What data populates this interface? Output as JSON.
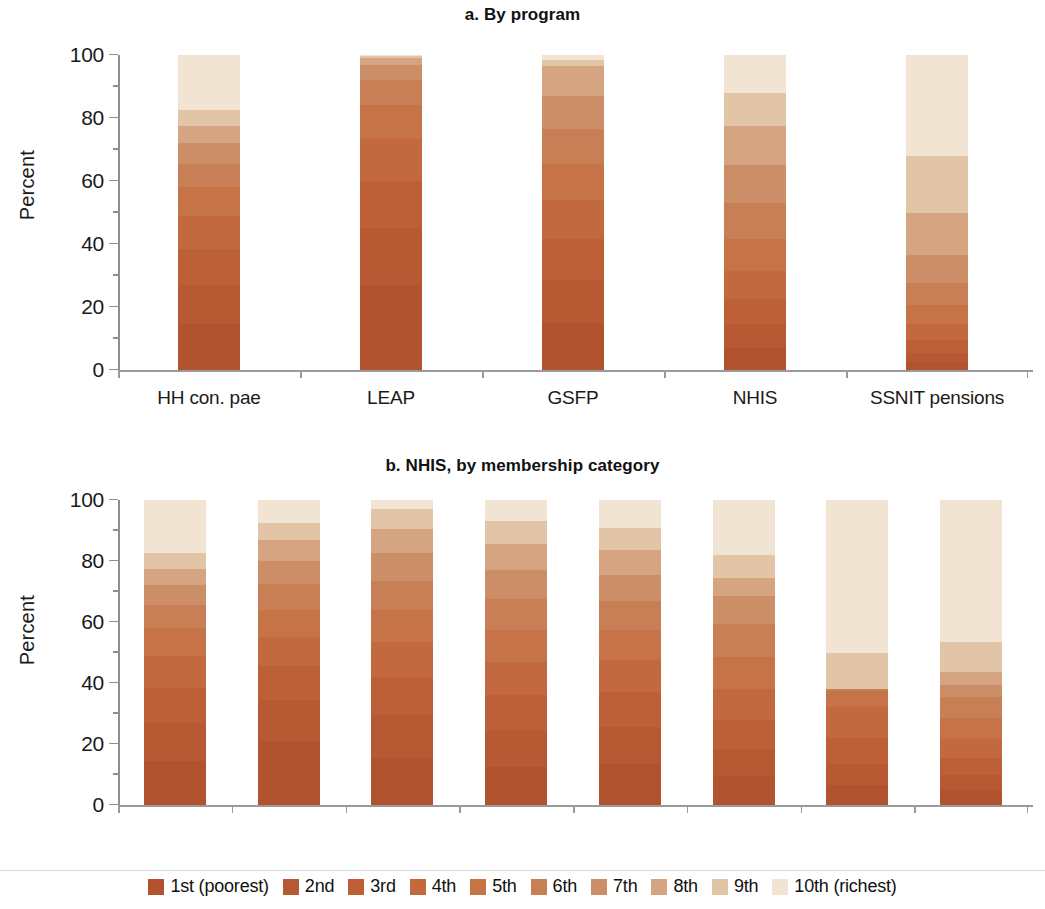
{
  "figure": {
    "y_axis_title": "Percent",
    "y_ticks": [
      "0",
      "20",
      "40",
      "60",
      "80",
      "100"
    ]
  },
  "panel_a": {
    "title": "a. By program",
    "y_axis_title": "Percent",
    "categories": [
      "HH con. pae",
      "LEAP",
      "GSFP",
      "NHIS",
      "SSNIT pensions"
    ]
  },
  "panel_b": {
    "title": "b. NHIS, by membership category",
    "y_axis_title": "Percent",
    "categories": [
      "HH con.\npae",
      "Indigent",
      "Age <18\nyears",
      "FMC",
      "Age ≥70\nyears",
      "Self-\npaid",
      "Employer\npaid",
      "SSNIT\npaid"
    ]
  },
  "legend": {
    "items": [
      {
        "label": "1st (poorest)",
        "color": "#b1532f"
      },
      {
        "label": "2nd",
        "color": "#b75933"
      },
      {
        "label": "3rd",
        "color": "#bd6038"
      },
      {
        "label": "4th",
        "color": "#c2693f"
      },
      {
        "label": "5th",
        "color": "#c67348"
      },
      {
        "label": "6th",
        "color": "#c87f55"
      },
      {
        "label": "7th",
        "color": "#cb8e67"
      },
      {
        "label": "8th",
        "color": "#d5a581"
      },
      {
        "label": "9th",
        "color": "#e2c4a6"
      },
      {
        "label": "10th (richest)",
        "color": "#f1e4d2"
      }
    ]
  },
  "chart_data": [
    {
      "type": "bar",
      "subtype": "stacked-percent",
      "panel": "a",
      "title": "a. By program",
      "xlabel": "",
      "ylabel": "Percent",
      "ylim": [
        0,
        100
      ],
      "yticks": [
        0,
        20,
        40,
        60,
        80,
        100
      ],
      "grid": false,
      "legend_position": "bottom",
      "categories": [
        "HH con. pae",
        "LEAP",
        "GSFP",
        "NHIS",
        "SSNIT pensions"
      ],
      "series": [
        {
          "name": "1st (poorest)",
          "color": "#b1532f",
          "values": [
            14.5,
            27.0,
            15.0,
            7.0,
            2.5
          ]
        },
        {
          "name": "2nd",
          "color": "#b75933",
          "values": [
            12.5,
            18.0,
            13.5,
            7.5,
            3.0
          ]
        },
        {
          "name": "3rd",
          "color": "#bd6038",
          "values": [
            11.5,
            15.0,
            13.0,
            8.0,
            4.0
          ]
        },
        {
          "name": "4th",
          "color": "#c2693f",
          "values": [
            10.5,
            13.5,
            12.5,
            9.0,
            5.0
          ]
        },
        {
          "name": "5th",
          "color": "#c67348",
          "values": [
            9.0,
            10.5,
            11.5,
            10.0,
            6.0
          ]
        },
        {
          "name": "6th",
          "color": "#c87f55",
          "values": [
            7.5,
            8.0,
            11.0,
            11.5,
            7.0
          ]
        },
        {
          "name": "7th",
          "color": "#cb8e67",
          "values": [
            6.5,
            5.0,
            10.5,
            12.0,
            9.0
          ]
        },
        {
          "name": "8th",
          "color": "#d5a581",
          "values": [
            5.5,
            2.0,
            9.5,
            12.5,
            13.5
          ]
        },
        {
          "name": "9th",
          "color": "#e2c4a6",
          "values": [
            5.0,
            0.8,
            2.0,
            10.5,
            18.0
          ]
        },
        {
          "name": "10th (richest)",
          "color": "#f1e4d2",
          "values": [
            17.5,
            0.2,
            1.5,
            12.0,
            32.0
          ]
        }
      ]
    },
    {
      "type": "bar",
      "subtype": "stacked-percent",
      "panel": "b",
      "title": "b. NHIS, by membership category",
      "xlabel": "",
      "ylabel": "Percent",
      "ylim": [
        0,
        100
      ],
      "yticks": [
        0,
        20,
        40,
        60,
        80,
        100
      ],
      "grid": false,
      "legend_position": "bottom",
      "categories": [
        "HH con. pae",
        "Indigent",
        "Age <18 years",
        "FMC",
        "Age ≥70 years",
        "Self-paid",
        "Employer paid",
        "SSNIT paid"
      ],
      "series": [
        {
          "name": "1st (poorest)",
          "color": "#b1532f",
          "values": [
            14.5,
            21.0,
            15.5,
            12.5,
            13.5,
            9.5,
            6.5,
            5.0
          ]
        },
        {
          "name": "2nd",
          "color": "#b75933",
          "values": [
            12.5,
            13.5,
            14.0,
            12.0,
            12.0,
            9.0,
            7.0,
            5.0
          ]
        },
        {
          "name": "3rd",
          "color": "#bd6038",
          "values": [
            11.5,
            11.0,
            12.5,
            11.5,
            11.5,
            9.5,
            8.5,
            5.5
          ]
        },
        {
          "name": "4th",
          "color": "#c2693f",
          "values": [
            10.5,
            9.5,
            11.5,
            11.0,
            10.5,
            10.0,
            10.0,
            6.0
          ]
        },
        {
          "name": "5th",
          "color": "#c67348",
          "values": [
            9.0,
            9.0,
            10.5,
            10.5,
            10.0,
            10.5,
            5.5,
            7.0
          ]
        },
        {
          "name": "6th",
          "color": "#c87f55",
          "values": [
            7.5,
            8.5,
            9.5,
            10.0,
            9.5,
            11.0,
            0.5,
            7.0
          ]
        },
        {
          "name": "7th",
          "color": "#cb8e67",
          "values": [
            6.5,
            7.5,
            9.0,
            9.5,
            8.5,
            9.0,
            0.0,
            4.0
          ]
        },
        {
          "name": "8th",
          "color": "#d5a581",
          "values": [
            5.5,
            7.0,
            8.0,
            8.5,
            8.0,
            6.0,
            0.0,
            4.0
          ]
        },
        {
          "name": "9th",
          "color": "#e2c4a6",
          "values": [
            5.0,
            5.5,
            6.5,
            7.5,
            7.5,
            7.5,
            12.0,
            10.0
          ]
        },
        {
          "name": "10th (richest)",
          "color": "#f1e4d2",
          "values": [
            17.5,
            7.5,
            3.0,
            7.0,
            9.0,
            18.0,
            50.0,
            46.5
          ]
        }
      ]
    }
  ]
}
